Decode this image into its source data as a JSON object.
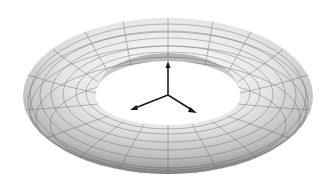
{
  "diagram": {
    "colors": {
      "background": "#ffffff",
      "surface_light": "#f4f4f4",
      "surface_dark": "#9a9a9a",
      "grid": "#555555",
      "axes": "#1a1a1a"
    },
    "axes": {
      "origin": [
        168,
        95
      ],
      "arrows": [
        {
          "name": "z-axis",
          "tip": [
            168,
            62
          ]
        },
        {
          "name": "x-axis",
          "tip": [
            131,
            110
          ]
        },
        {
          "name": "y-axis",
          "tip": [
            196,
            113
          ]
        }
      ]
    }
  }
}
